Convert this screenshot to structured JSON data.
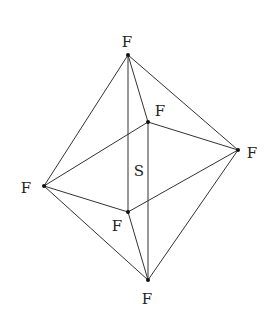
{
  "diagram": {
    "colors": {
      "line": "#333333",
      "node": "#111111",
      "text": "#222222",
      "background": "#ffffff"
    },
    "center_label": "S",
    "atoms": [
      {
        "id": "top",
        "label": "F",
        "x": 128,
        "y": 55
      },
      {
        "id": "back",
        "label": "F",
        "x": 148,
        "y": 122
      },
      {
        "id": "right",
        "label": "F",
        "x": 238,
        "y": 150
      },
      {
        "id": "left",
        "label": "F",
        "x": 44,
        "y": 186
      },
      {
        "id": "front",
        "label": "F",
        "x": 128,
        "y": 212
      },
      {
        "id": "bottom",
        "label": "F",
        "x": 148,
        "y": 280
      }
    ]
  }
}
